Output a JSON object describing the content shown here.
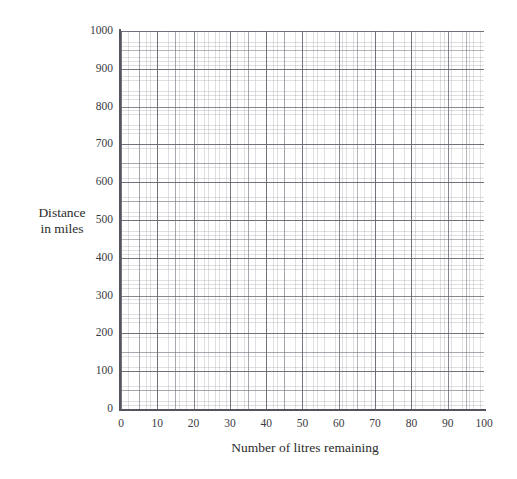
{
  "chart_data": {
    "type": "scatter",
    "title": "",
    "xlabel": "Number of litres remaining",
    "ylabel_line1": "Distance",
    "ylabel_line2": "in miles",
    "xlim": [
      0,
      100
    ],
    "ylim": [
      0,
      1000
    ],
    "x_ticks": [
      "0",
      "10",
      "20",
      "30",
      "40",
      "50",
      "60",
      "70",
      "80",
      "90",
      "100"
    ],
    "x_tick_values": [
      0,
      10,
      20,
      30,
      40,
      50,
      60,
      70,
      80,
      90,
      100
    ],
    "y_ticks": [
      "0",
      "100",
      "200",
      "300",
      "400",
      "500",
      "600",
      "700",
      "800",
      "900",
      "1000"
    ],
    "y_tick_values": [
      0,
      100,
      200,
      300,
      400,
      500,
      600,
      700,
      800,
      900,
      1000
    ],
    "series": [],
    "data_points": [],
    "grid": "on",
    "grid_minor": "on",
    "legend": "none",
    "note": "Empty graph paper grid with labelled axes; no data plotted."
  },
  "colors": {
    "background": "#ffffff",
    "axis": "#55555e",
    "text": "#2b2b2b",
    "grid_major": "#60606c",
    "grid_medium": "#787884",
    "grid_fine": "#9696a0"
  }
}
